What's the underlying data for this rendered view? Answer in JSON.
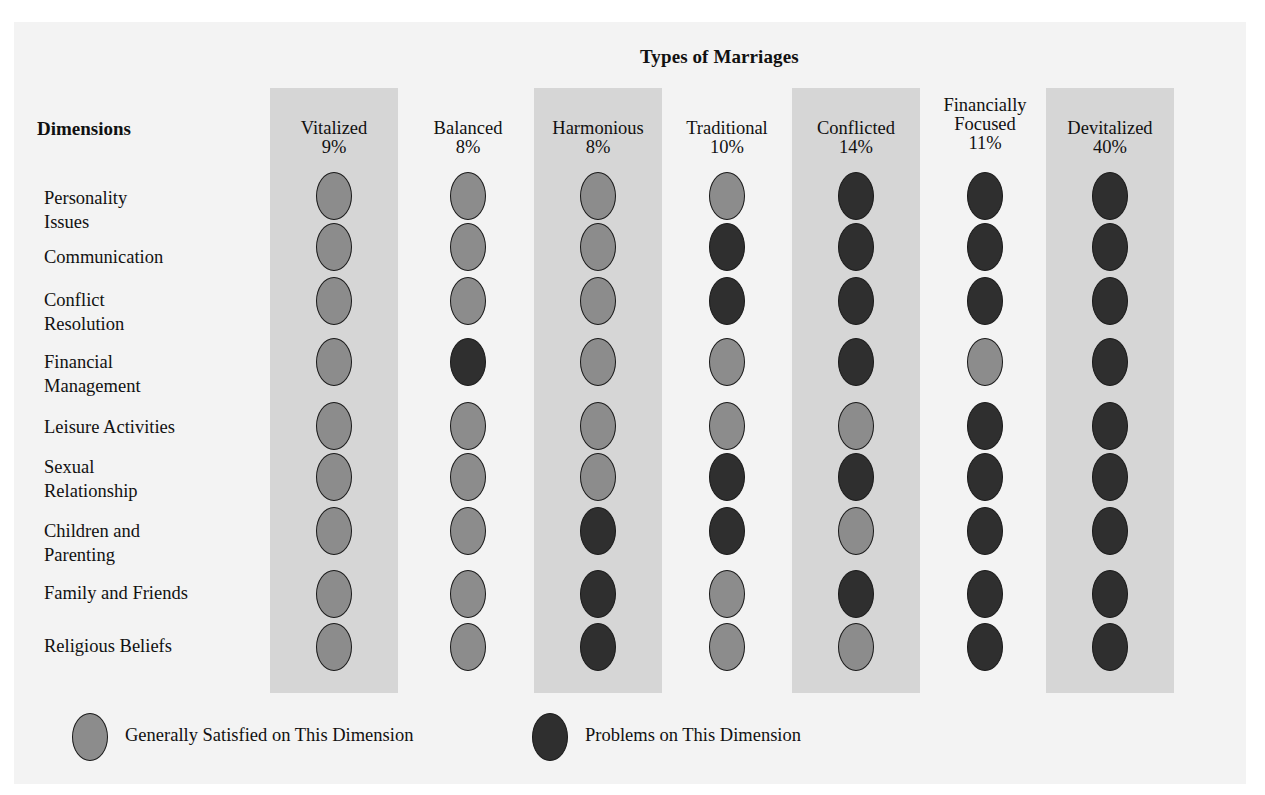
{
  "title": "Types of Marriages",
  "dimensions_header": "Dimensions",
  "colors": {
    "background": "#f3f3f3",
    "column_band": "#d6d6d6",
    "satisfied": "#8c8c8c",
    "problems": "#2f2f2f"
  },
  "columns": [
    {
      "name": "Vitalized",
      "name_line1": "",
      "percent": "9%",
      "banded": true
    },
    {
      "name": "Balanced",
      "name_line1": "",
      "percent": "8%",
      "banded": false
    },
    {
      "name": "Harmonious",
      "name_line1": "",
      "percent": "8%",
      "banded": true
    },
    {
      "name": "Traditional",
      "name_line1": "",
      "percent": "10%",
      "banded": false
    },
    {
      "name": "Conflicted",
      "name_line1": "",
      "percent": "14%",
      "banded": true
    },
    {
      "name": "Focused",
      "name_line1": "Financially",
      "percent": "11%",
      "banded": false
    },
    {
      "name": "Devitalized",
      "name_line1": "",
      "percent": "40%",
      "banded": true
    }
  ],
  "rows": [
    {
      "line1": "Personality",
      "line2": "Issues"
    },
    {
      "line1": "Communication",
      "line2": ""
    },
    {
      "line1": "Conflict",
      "line2": "Resolution"
    },
    {
      "line1": "Financial",
      "line2": "Management"
    },
    {
      "line1": "Leisure Activities",
      "line2": ""
    },
    {
      "line1": "Sexual",
      "line2": "Relationship"
    },
    {
      "line1": "Children and",
      "line2": "Parenting"
    },
    {
      "line1": "Family and Friends",
      "line2": ""
    },
    {
      "line1": "Religious Beliefs",
      "line2": ""
    }
  ],
  "legend": {
    "satisfied": "Generally Satisfied on This Dimension",
    "problems": "Problems on This Dimension"
  },
  "chart_data": {
    "type": "table",
    "title": "Types of Marriages",
    "row_header": "Dimensions",
    "columns": [
      "Vitalized",
      "Balanced",
      "Harmonious",
      "Traditional",
      "Conflicted",
      "Financially Focused",
      "Devitalized"
    ],
    "column_percentages": [
      9,
      8,
      8,
      10,
      14,
      11,
      40
    ],
    "rows": [
      "Personality Issues",
      "Communication",
      "Conflict Resolution",
      "Financial Management",
      "Leisure Activities",
      "Sexual Relationship",
      "Children and Parenting",
      "Family and Friends",
      "Religious Beliefs"
    ],
    "legend": {
      "S": "Generally Satisfied on This Dimension",
      "P": "Problems on This Dimension"
    },
    "cells": [
      [
        "S",
        "S",
        "S",
        "S",
        "P",
        "P",
        "P"
      ],
      [
        "S",
        "S",
        "S",
        "P",
        "P",
        "P",
        "P"
      ],
      [
        "S",
        "S",
        "S",
        "P",
        "P",
        "P",
        "P"
      ],
      [
        "S",
        "P",
        "S",
        "S",
        "P",
        "S",
        "P"
      ],
      [
        "S",
        "S",
        "S",
        "S",
        "S",
        "P",
        "P"
      ],
      [
        "S",
        "S",
        "S",
        "P",
        "P",
        "P",
        "P"
      ],
      [
        "S",
        "S",
        "P",
        "P",
        "S",
        "P",
        "P"
      ],
      [
        "S",
        "S",
        "P",
        "S",
        "P",
        "P",
        "P"
      ],
      [
        "S",
        "S",
        "P",
        "S",
        "S",
        "P",
        "P"
      ]
    ]
  }
}
